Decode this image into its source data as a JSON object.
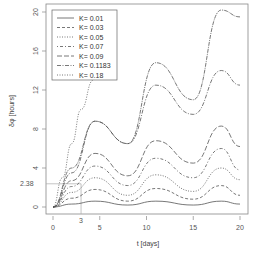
{
  "chart_data": {
    "type": "line",
    "title": "",
    "xlabel": "t [days]",
    "ylabel": "δφ [hours]",
    "xlim": [
      0,
      20
    ],
    "ylim": [
      0,
      20
    ],
    "xticks": [
      "0",
      "5",
      "10",
      "15",
      "20"
    ],
    "yticks": [
      "0",
      "4",
      "8",
      "12",
      "16",
      "20"
    ],
    "extra_xtick": "3",
    "extra_ytick": "2.38",
    "grid": false,
    "legend_position": "top-left",
    "legend": [
      "K= 0.01",
      "K= 0.03",
      "K= 0.05",
      "K= 0.07",
      "K= 0.09",
      "K= 0.1183",
      "K= 0.18"
    ],
    "annotations": [
      {
        "type": "reference-line",
        "x": 3,
        "y": 2.38,
        "note": "gray guide lines at t=3 and δφ=2.38"
      }
    ],
    "series": [
      {
        "name": "K= 0.01",
        "style": "solid",
        "x": [
          0,
          2,
          4.5,
          8,
          11,
          15,
          18,
          20
        ],
        "values": [
          0,
          0.3,
          0.6,
          0.2,
          0.6,
          0.2,
          0.6,
          0.3
        ]
      },
      {
        "name": "K= 0.03",
        "style": "dashed",
        "x": [
          0,
          2,
          4.5,
          8,
          11,
          15,
          18,
          20
        ],
        "values": [
          0,
          0.9,
          1.8,
          0.6,
          1.9,
          0.8,
          2.2,
          1.2
        ]
      },
      {
        "name": "K= 0.05",
        "style": "dotted",
        "x": [
          0,
          2,
          4.5,
          8,
          11,
          15,
          18,
          20
        ],
        "values": [
          0,
          1.5,
          3.0,
          1.2,
          3.3,
          1.6,
          4.0,
          2.8
        ]
      },
      {
        "name": "K= 0.07",
        "style": "dotdash",
        "x": [
          0,
          2,
          4.5,
          8,
          11,
          15,
          18,
          20
        ],
        "values": [
          0,
          2.1,
          4.2,
          2.2,
          5.0,
          3.0,
          6.0,
          3.8
        ]
      },
      {
        "name": "K= 0.09",
        "style": "longdash",
        "x": [
          0,
          2,
          4.5,
          8,
          11,
          15,
          18,
          20
        ],
        "values": [
          0,
          2.7,
          5.5,
          3.2,
          6.8,
          4.5,
          8.3,
          6.2
        ]
      },
      {
        "name": "K= 0.1183",
        "style": "twodash",
        "x": [
          0,
          2,
          4.5,
          8,
          11,
          15,
          18,
          20
        ],
        "values": [
          0,
          3.5,
          8.8,
          6.5,
          12.5,
          9.5,
          14.0,
          12.5
        ]
      },
      {
        "name": "K= 0.1183b",
        "style": "dotdash-upper",
        "x": [
          0,
          2,
          4.5,
          8,
          11,
          15,
          18,
          20
        ],
        "values": [
          0,
          4.0,
          8.8,
          6.5,
          14.8,
          11.0,
          20.2,
          19.5
        ]
      },
      {
        "name": "K= 0.18",
        "style": "dotted-steep",
        "x": [
          0,
          1,
          2,
          3,
          4.3
        ],
        "values": [
          0,
          3,
          6.5,
          10,
          13
        ]
      }
    ]
  }
}
